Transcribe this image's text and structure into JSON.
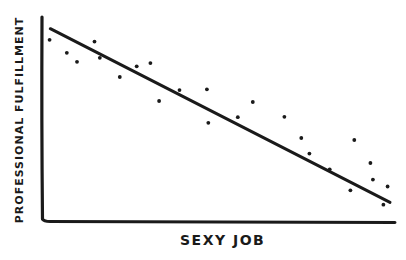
{
  "chart_data": {
    "type": "scatter",
    "title": "",
    "xlabel": "SEXY JOB",
    "ylabel": "PROFESSIONAL FULFILLMENT",
    "xlim": [
      0,
      100
    ],
    "ylim": [
      0,
      100
    ],
    "grid": false,
    "legend": null,
    "ticks": {
      "x": [],
      "y": []
    },
    "series": [
      {
        "name": "observations",
        "kind": "points",
        "points": [
          {
            "x": 1.6,
            "y": 88.7
          },
          {
            "x": 6.5,
            "y": 82.3
          },
          {
            "x": 9.4,
            "y": 77.8
          },
          {
            "x": 14.4,
            "y": 87.8
          },
          {
            "x": 15.9,
            "y": 79.8
          },
          {
            "x": 21.6,
            "y": 70.3
          },
          {
            "x": 26.4,
            "y": 75.6
          },
          {
            "x": 30.3,
            "y": 77.2
          },
          {
            "x": 32.8,
            "y": 58.4
          },
          {
            "x": 38.6,
            "y": 63.8
          },
          {
            "x": 46.4,
            "y": 64.2
          },
          {
            "x": 46.8,
            "y": 47.6
          },
          {
            "x": 55.2,
            "y": 50.4
          },
          {
            "x": 59.5,
            "y": 57.9
          },
          {
            "x": 68.5,
            "y": 50.6
          },
          {
            "x": 73.3,
            "y": 40.1
          },
          {
            "x": 75.6,
            "y": 32.4
          },
          {
            "x": 81.4,
            "y": 24.6
          },
          {
            "x": 88.4,
            "y": 39.1
          },
          {
            "x": 87.3,
            "y": 14.2
          },
          {
            "x": 93.0,
            "y": 27.7
          },
          {
            "x": 93.7,
            "y": 19.5
          },
          {
            "x": 97.9,
            "y": 16.1
          },
          {
            "x": 96.7,
            "y": 7.1
          }
        ]
      },
      {
        "name": "trend line",
        "kind": "line",
        "points": [
          {
            "x": 1.8,
            "y": 94.2
          },
          {
            "x": 100.0,
            "y": 8.2
          }
        ]
      }
    ]
  },
  "colors": {
    "ink": "#1a1a1a",
    "background": "#ffffff"
  }
}
